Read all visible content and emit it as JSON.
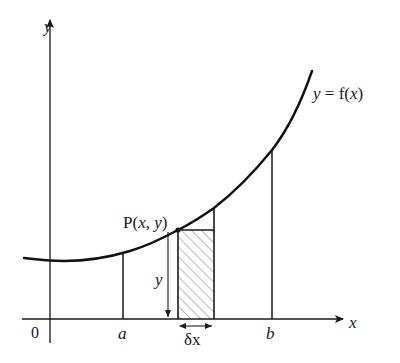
{
  "diagram": {
    "axes": {
      "x_label": "x",
      "y_label": "y",
      "origin_label": "0"
    },
    "curve": {
      "label_prefix": "y = f(",
      "label_var": "x",
      "label_suffix": ")"
    },
    "bounds": {
      "a_label": "a",
      "b_label": "b"
    },
    "point": {
      "label_prefix": "P(",
      "label_vars": "x, y",
      "label_suffix": ")"
    },
    "strip": {
      "height_label": "y",
      "width_label": "δx",
      "hatched": true
    },
    "colors": {
      "ink": "#1a1a1a",
      "background": "#ffffff",
      "hatch": "#555555"
    }
  }
}
